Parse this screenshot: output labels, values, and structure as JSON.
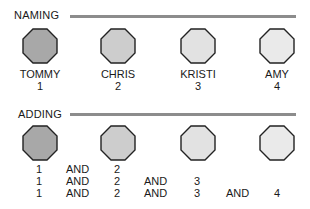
{
  "naming": {
    "label": "NAMING",
    "people": [
      {
        "name": "TOMMY",
        "number": "1",
        "fill": "#a8a8a8"
      },
      {
        "name": "CHRIS",
        "number": "2",
        "fill": "#cdcdcd"
      },
      {
        "name": "KRISTI",
        "number": "3",
        "fill": "#e2e2e2"
      },
      {
        "name": "AMY",
        "number": "4",
        "fill": "#eaeaea"
      }
    ]
  },
  "adding": {
    "label": "ADDING",
    "shapes": [
      {
        "fill": "#a8a8a8"
      },
      {
        "fill": "#cdcdcd"
      },
      {
        "fill": "#e2e2e2"
      },
      {
        "fill": "#eaeaea"
      }
    ],
    "rows": [
      [
        "1",
        "AND",
        "2",
        "",
        "",
        "",
        ""
      ],
      [
        "1",
        "AND",
        "2",
        "AND",
        "3",
        "",
        ""
      ],
      [
        "1",
        "AND",
        "2",
        "AND",
        "3",
        "AND",
        "4"
      ]
    ]
  },
  "colors": {
    "rule": "#8c8c8c",
    "outline": "#222222"
  }
}
